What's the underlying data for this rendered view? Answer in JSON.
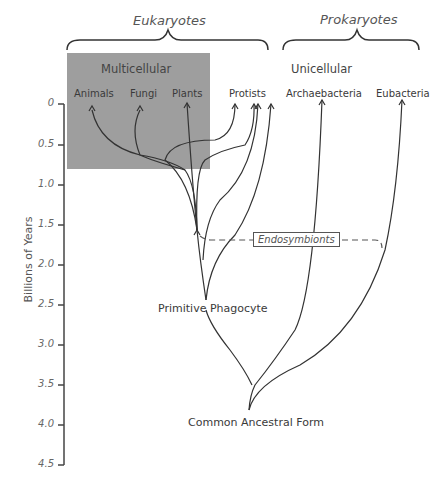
{
  "groups": {
    "eukaryotes": "Eukaryotes",
    "prokaryotes": "Prokaryotes"
  },
  "subgroups": {
    "multicellular": "Multicellular",
    "unicellular": "Unicellular"
  },
  "taxa": [
    "Animals",
    "Fungi",
    "Plants",
    "Protists",
    "Archaebacteria",
    "Eubacteria"
  ],
  "nodes": {
    "primitive_phagocyte": "Primitive Phagocyte",
    "common_ancestor": "Common Ancestral Form",
    "endosymbionts": "Endosymbionts"
  },
  "axis": {
    "label": "Billions of Years",
    "ticks": [
      "0",
      "0.5",
      "1.0",
      "1.5",
      "2.0",
      "2.5",
      "3.0",
      "3.5",
      "4.0",
      "4.5"
    ]
  },
  "colors": {
    "multicellular_box": "#9e9e9e",
    "lines": "#333333"
  }
}
